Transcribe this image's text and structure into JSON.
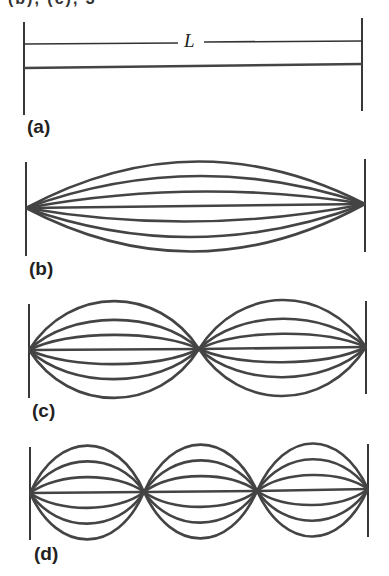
{
  "figure": {
    "top_caption_fragment": "(b), (c),    3",
    "dimension_label": "L",
    "colors": {
      "string": "#444444",
      "support": "#222222",
      "background": "#ffffff"
    },
    "panels": [
      {
        "id": "a",
        "label": "(a)",
        "description": "String of length L fixed between two supports, at rest",
        "loops": 0,
        "curves": 1
      },
      {
        "id": "b",
        "label": "(b)",
        "description": "Fundamental mode: one loop",
        "loops": 1,
        "curves": 7
      },
      {
        "id": "c",
        "label": "(c)",
        "description": "Second harmonic: two loops, one interior node",
        "loops": 2,
        "curves": 7
      },
      {
        "id": "d",
        "label": "(d)",
        "description": "Third harmonic: three loops, two interior nodes",
        "loops": 3,
        "curves": 7
      }
    ]
  }
}
